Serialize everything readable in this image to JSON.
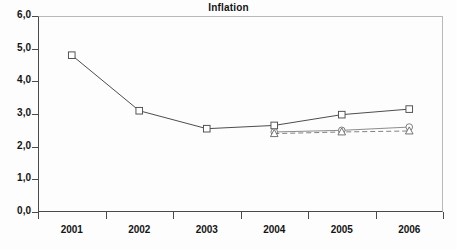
{
  "chart_data": {
    "type": "line",
    "title": "Inflation",
    "xlabel": "",
    "ylabel": "",
    "x": [
      "2001",
      "2002",
      "2003",
      "2004",
      "2005",
      "2006"
    ],
    "categories": [
      "2001",
      "2002",
      "2003",
      "2004",
      "2005",
      "2006"
    ],
    "ylim": [
      0.0,
      6.0
    ],
    "ytick_labels": [
      "0,0",
      "1,0",
      "2,0",
      "3,0",
      "4,0",
      "5,0",
      "6,0"
    ],
    "ytick_values": [
      0.0,
      1.0,
      2.0,
      3.0,
      4.0,
      5.0,
      6.0
    ],
    "xtick_labels": [
      "2001",
      "2002",
      "2003",
      "2004",
      "2005",
      "2006"
    ],
    "grid": false,
    "legend": "none",
    "decimal_separator": ",",
    "series": [
      {
        "name": "series-square",
        "marker": "square",
        "linestyle": "solid",
        "color": "#4d4d4d",
        "x": [
          "2001",
          "2002",
          "2003",
          "2004",
          "2005",
          "2006"
        ],
        "values": [
          4.8,
          3.1,
          2.55,
          2.65,
          2.98,
          3.15
        ]
      },
      {
        "name": "series-circle",
        "marker": "circle",
        "linestyle": "solid",
        "color": "#777777",
        "x": [
          "2004",
          "2005",
          "2006"
        ],
        "values": [
          2.45,
          2.5,
          2.6
        ]
      },
      {
        "name": "series-triangle",
        "marker": "triangle",
        "linestyle": "dashed",
        "color": "#6b6b6b",
        "x": [
          "2004",
          "2005",
          "2006"
        ],
        "values": [
          2.4,
          2.45,
          2.48
        ]
      }
    ]
  },
  "axes": {
    "y_ticks": [
      {
        "label": "0,0",
        "value": 0.0
      },
      {
        "label": "1,0",
        "value": 1.0
      },
      {
        "label": "2,0",
        "value": 2.0
      },
      {
        "label": "3,0",
        "value": 3.0
      },
      {
        "label": "4,0",
        "value": 4.0
      },
      {
        "label": "5,0",
        "value": 5.0
      },
      {
        "label": "6,0",
        "value": 6.0
      }
    ],
    "x_ticks": [
      {
        "label": "2001"
      },
      {
        "label": "2002"
      },
      {
        "label": "2003"
      },
      {
        "label": "2004"
      },
      {
        "label": "2005"
      },
      {
        "label": "2006"
      }
    ]
  },
  "colors": {
    "axis": "#4a4a4a",
    "frame_light": "#b9b9b9",
    "text": "#141414",
    "series_square": "#4d4d4d",
    "series_circle": "#777777",
    "series_triangle": "#6b6b6b",
    "background": "#fdfdfd"
  }
}
